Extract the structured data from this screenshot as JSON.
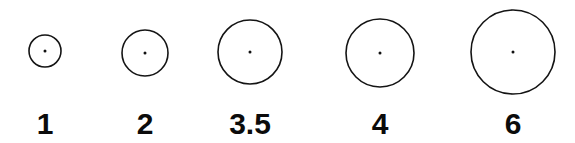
{
  "figure": {
    "background_color": "#ffffff",
    "stroke_color": "#141414",
    "label_color": "#0b0b0b",
    "dot_color": "#111111",
    "width": 575,
    "height": 143
  },
  "chart_data": {
    "type": "scatter",
    "title": "",
    "xlabel": "",
    "ylabel": "",
    "legend_position": "none",
    "grid": false,
    "categories": [
      "1",
      "2",
      "3.5",
      "4",
      "6"
    ],
    "values": [
      1,
      2,
      3.5,
      4,
      6
    ],
    "marker_radii_px": [
      16,
      23,
      32,
      34,
      42
    ],
    "items": [
      {
        "label": "1",
        "value": 1,
        "cx": 45,
        "cy": 51,
        "r": 16
      },
      {
        "label": "2",
        "value": 2,
        "cx": 145,
        "cy": 53,
        "r": 23
      },
      {
        "label": "3.5",
        "value": 3.5,
        "cx": 250,
        "cy": 52,
        "r": 32
      },
      {
        "label": "4",
        "value": 4,
        "cx": 380,
        "cy": 53,
        "r": 34
      },
      {
        "label": "6",
        "value": 6,
        "cx": 513,
        "cy": 52,
        "r": 42
      }
    ],
    "label_baseline_y": 134
  }
}
